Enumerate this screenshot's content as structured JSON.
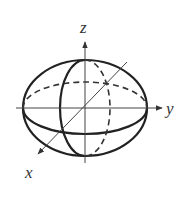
{
  "figure": {
    "stroke_color": "#222222",
    "axis_color": "#444444",
    "labels": {
      "x": "x",
      "y": "y",
      "z": "z"
    },
    "ellipsoid": {
      "center": [
        85,
        108
      ],
      "outline": {
        "rx": 62,
        "ry": 48
      },
      "equator": {
        "rx": 62,
        "ry": 26,
        "front": "solid",
        "back": "dashed"
      },
      "meridian": {
        "rx": 25,
        "ry": 48,
        "left": "solid",
        "right": "dashed"
      }
    },
    "axes": {
      "z": {
        "from": [
          85,
          163
        ],
        "to": [
          85,
          42
        ]
      },
      "y": {
        "from": [
          16,
          108
        ],
        "to": [
          162,
          108
        ]
      },
      "x": {
        "from": [
          127,
          62
        ],
        "to": [
          38,
          154
        ]
      }
    }
  }
}
